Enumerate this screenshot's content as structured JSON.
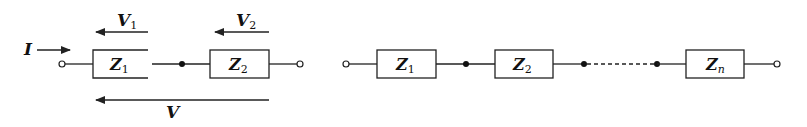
{
  "diagram_left": {
    "current_label": {
      "main": "I"
    },
    "impedances": [
      {
        "main": "Z",
        "sub": "1"
      },
      {
        "main": "Z",
        "sub": "2"
      }
    ],
    "voltages": [
      {
        "main": "V",
        "sub": "1"
      },
      {
        "main": "V",
        "sub": "2"
      }
    ],
    "total_voltage": {
      "main": "V"
    }
  },
  "diagram_right": {
    "impedances": [
      {
        "main": "Z",
        "sub": "1"
      },
      {
        "main": "Z",
        "sub": "2"
      },
      {
        "main": "Z",
        "sub": "n"
      }
    ]
  },
  "colors": {
    "line": "#222222",
    "background": "#ffffff"
  }
}
